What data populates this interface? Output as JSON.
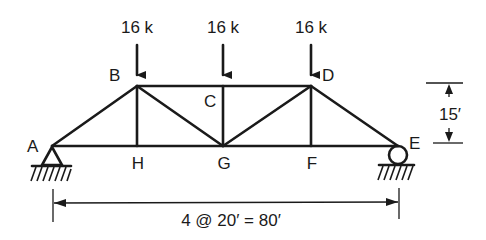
{
  "diagram": {
    "type": "truss",
    "loads": [
      {
        "joint": "B",
        "label": "16 k"
      },
      {
        "joint": "C",
        "label": "16 k"
      },
      {
        "joint": "D",
        "label": "16 k"
      }
    ],
    "joints": {
      "A": "A",
      "B": "B",
      "C": "C",
      "D": "D",
      "E": "E",
      "F": "F",
      "G": "G",
      "H": "H"
    },
    "dimensions": {
      "height": "15′",
      "span": "4 @ 20′ = 80′"
    },
    "supports": {
      "A": "pin",
      "E": "roller"
    },
    "colors": {
      "line": "#1a1a1a",
      "background": "#ffffff"
    }
  }
}
